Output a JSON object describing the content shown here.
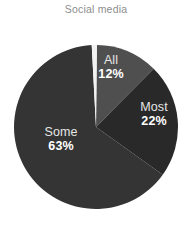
{
  "chart_data": {
    "type": "pie",
    "title": "Social media",
    "xlabel": "",
    "ylabel": "",
    "unit": "%",
    "legend_position": "none",
    "grid": false,
    "start_angle_deg": 357,
    "direction": "clockwise",
    "categories": [
      "All",
      "Most",
      "Some"
    ],
    "values": [
      12,
      22,
      63
    ],
    "labels": [
      {
        "name": "All",
        "value": 12,
        "value_text": "12%",
        "color": "#4f4f4f"
      },
      {
        "name": "Most",
        "value": 22,
        "value_text": "22%",
        "color": "#292929"
      },
      {
        "name": "Some",
        "value": 63,
        "value_text": "63%",
        "color": "#343434"
      }
    ],
    "colors": {
      "all_slice": "#4f4f4f",
      "most_slice": "#292929",
      "some_slice": "#343434",
      "gap_wedge": "#f2f2f2",
      "title_text": "#8d8d8d",
      "category_text": "#e6e6e6",
      "percent_text": "#ffffff",
      "background": "#ffffff"
    }
  },
  "figure": {
    "title": "Social media",
    "pie": {
      "center_x": 96,
      "center_y": 127,
      "radius": 82
    },
    "slices": {
      "all": {
        "category": "All",
        "percent": "12%"
      },
      "most": {
        "category": "Most",
        "percent": "22%"
      },
      "some": {
        "category": "Some",
        "percent": "63%"
      }
    }
  }
}
